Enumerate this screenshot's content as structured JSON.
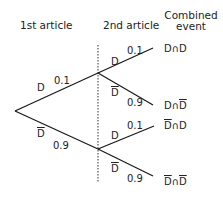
{
  "headers": {
    "first": "1st article",
    "second": "2nd article",
    "combined_line1": "Combined",
    "combined_line2": "event"
  },
  "first_branches": {
    "upper": {
      "event": "D",
      "complement": false,
      "prob": "0.1"
    },
    "lower": {
      "event": "D",
      "complement": true,
      "prob": "0.9"
    }
  },
  "second_branches": {
    "upper_up": {
      "event": "D",
      "complement": false,
      "prob": "0.1"
    },
    "upper_down": {
      "event": "D",
      "complement": true,
      "prob": "0.9"
    },
    "lower_up": {
      "event": "D",
      "complement": false,
      "prob": "0.1"
    },
    "lower_down": {
      "event": "D",
      "complement": true,
      "prob": "0.9"
    }
  },
  "combined": {
    "e1": {
      "a": "D",
      "op": "∩",
      "b": "D",
      "a_bar": false,
      "b_bar": false
    },
    "e2": {
      "a": "D",
      "op": "∩",
      "b": "D",
      "a_bar": false,
      "b_bar": true
    },
    "e3": {
      "a": "D",
      "op": "∩",
      "b": "D",
      "a_bar": true,
      "b_bar": false
    },
    "e4": {
      "a": "D",
      "op": "∩",
      "b": "D",
      "a_bar": true,
      "b_bar": true
    }
  },
  "colors": {
    "line": "#1a1a1a",
    "text": "#222222"
  }
}
